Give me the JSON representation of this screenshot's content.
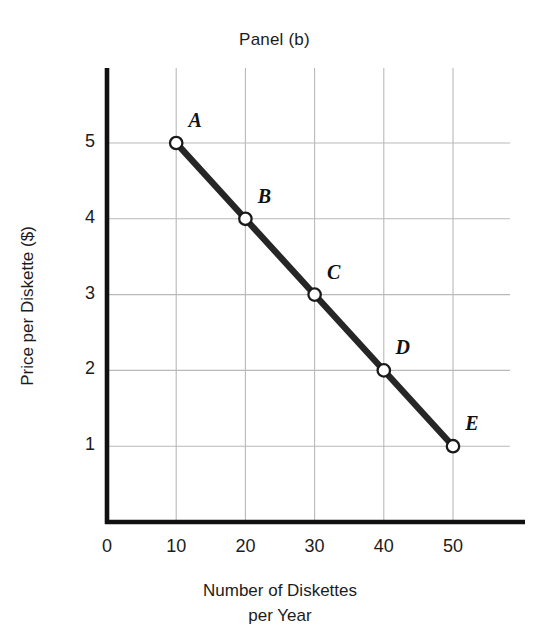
{
  "chart_data": {
    "type": "line",
    "title": "Panel (b)",
    "xlabel": "Number of Diskettes per Year",
    "xlabel_lines": [
      "Number of Diskettes",
      "per Year"
    ],
    "ylabel": "Price per Diskette ($)",
    "xlim": [
      0,
      55
    ],
    "ylim": [
      0,
      5.85
    ],
    "xticks": [
      "0",
      "10",
      "20",
      "30",
      "40",
      "50"
    ],
    "xtick_values": [
      0,
      10,
      20,
      30,
      40,
      50
    ],
    "yticks": [
      "1",
      "2",
      "3",
      "4",
      "5"
    ],
    "ytick_values": [
      1,
      2,
      3,
      4,
      5
    ],
    "grid": true,
    "legend": "none",
    "series": [
      {
        "name": "Demand",
        "x": [
          10,
          20,
          30,
          40,
          50
        ],
        "values": [
          5,
          4,
          3,
          2,
          1
        ],
        "point_labels": [
          "A",
          "B",
          "C",
          "D",
          "E"
        ],
        "line_color": "#262626",
        "marker_face_color": "#ffffff",
        "marker_edge_color": "#1a1a1a"
      }
    ],
    "points": [
      {
        "label": "A",
        "x": 10,
        "y": 5
      },
      {
        "label": "B",
        "x": 20,
        "y": 4
      },
      {
        "label": "C",
        "x": 30,
        "y": 3
      },
      {
        "label": "D",
        "x": 40,
        "y": 2
      },
      {
        "label": "E",
        "x": 50,
        "y": 1
      }
    ],
    "colors": {
      "axis": "#111111",
      "grid": "#b9b9b9",
      "background": "#ffffff",
      "text": "#1c1c1c"
    }
  }
}
